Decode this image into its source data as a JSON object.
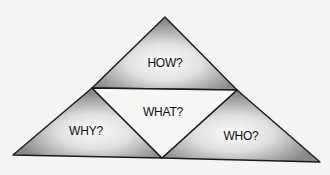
{
  "diagram": {
    "type": "triangle-of-triangles",
    "regions": [
      {
        "id": "top",
        "label": "HOW?"
      },
      {
        "id": "center",
        "label": "WHAT?"
      },
      {
        "id": "left",
        "label": "WHY?"
      },
      {
        "id": "right",
        "label": "WHO?"
      }
    ],
    "colors": {
      "background": "#f4f4f2",
      "shade_outer": "#8e8e8e",
      "shade_inner": "#fafafa",
      "center_fill": "#f6f6f4",
      "stroke": "#1a1a1a"
    }
  }
}
